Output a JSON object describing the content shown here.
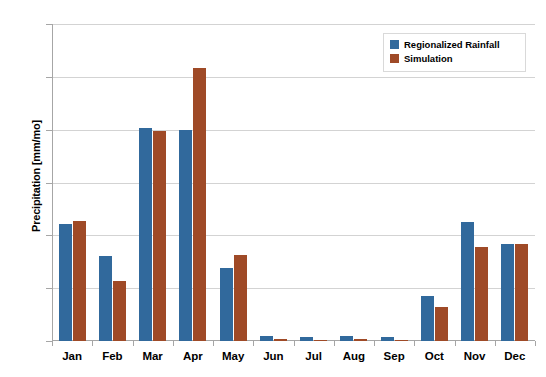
{
  "chart_data": {
    "type": "bar",
    "title": "",
    "xlabel": "",
    "ylabel": "Precipitation [mm/mo]",
    "categories": [
      "Jan",
      "Feb",
      "Mar",
      "Apr",
      "May",
      "Jun",
      "Jul",
      "Aug",
      "Sep",
      "Oct",
      "Nov",
      "Dec"
    ],
    "series": [
      {
        "name": "Regionalized Rainfall",
        "color": "#31699C",
        "values": [
          11.1,
          8.0,
          20.2,
          20.0,
          6.9,
          0.45,
          0.4,
          0.5,
          0.35,
          4.3,
          11.3,
          9.2
        ]
      },
      {
        "name": "Simulation",
        "color": "#9F4A27",
        "values": [
          11.4,
          5.7,
          19.9,
          25.8,
          8.1,
          0.15,
          0.1,
          0.15,
          0.1,
          3.2,
          8.9,
          9.2
        ]
      }
    ],
    "ylim": [
      0,
      30
    ],
    "yticks": [
      0,
      5,
      10,
      15,
      20,
      25,
      30
    ],
    "ytick_labels": [
      "0",
      "5",
      "10",
      "15",
      "20",
      "25",
      "30"
    ],
    "grid": true,
    "legend_position": "top-right"
  }
}
